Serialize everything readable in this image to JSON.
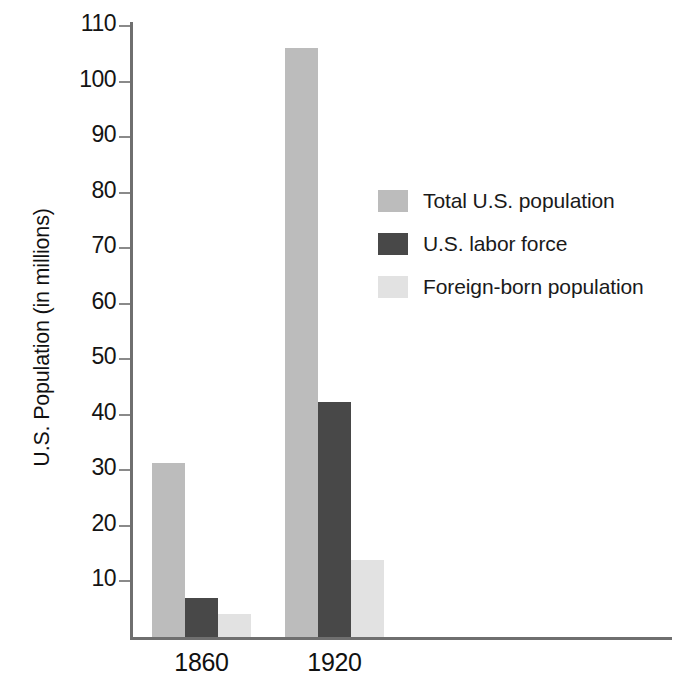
{
  "chart_data": {
    "type": "bar",
    "title": "",
    "xlabel": "",
    "ylabel": "U.S. Population (in millions)",
    "categories": [
      "1860",
      "1920"
    ],
    "series": [
      {
        "name": "Total U.S. population",
        "values": [
          31.4,
          106.0
        ],
        "color": "#bcbcbc"
      },
      {
        "name": "U.S. labor force",
        "values": [
          7.0,
          42.4
        ],
        "color": "#484848"
      },
      {
        "name": "Foreign-born population",
        "values": [
          4.1,
          13.9
        ],
        "color": "#e2e2e2"
      }
    ],
    "ylim": [
      0,
      115
    ],
    "yticks": [
      10,
      20,
      30,
      40,
      50,
      60,
      70,
      80,
      90,
      100,
      110
    ],
    "ytick_labels": [
      "10",
      "20",
      "30",
      "40",
      "50",
      "60",
      "70",
      "80",
      "90",
      "100",
      "110"
    ],
    "grid": false,
    "legend_position": "upper right"
  },
  "axis": {
    "y_title": "U.S. Population (in millions)",
    "ticks": [
      {
        "value": 110,
        "label": "110"
      },
      {
        "value": 100,
        "label": "100"
      },
      {
        "value": 90,
        "label": "90"
      },
      {
        "value": 80,
        "label": "80"
      },
      {
        "value": 70,
        "label": "70"
      },
      {
        "value": 60,
        "label": "60"
      },
      {
        "value": 50,
        "label": "50"
      },
      {
        "value": 40,
        "label": "40"
      },
      {
        "value": 30,
        "label": "30"
      },
      {
        "value": 20,
        "label": "20"
      },
      {
        "value": 10,
        "label": "10"
      }
    ]
  },
  "groups": [
    {
      "label": "1860",
      "bars": [
        {
          "series": "Total U.S. population",
          "value": 31.4
        },
        {
          "series": "U.S. labor force",
          "value": 7.0
        },
        {
          "series": "Foreign-born population",
          "value": 4.1
        }
      ]
    },
    {
      "label": "1920",
      "bars": [
        {
          "series": "Total U.S. population",
          "value": 106.0
        },
        {
          "series": "U.S. labor force",
          "value": 42.4
        },
        {
          "series": "Foreign-born population",
          "value": 13.9
        }
      ]
    }
  ],
  "legend": {
    "items": [
      {
        "label": "Total U.S. population",
        "color": "#bcbcbc"
      },
      {
        "label": "U.S. labor force",
        "color": "#484848"
      },
      {
        "label": "Foreign-born population",
        "color": "#e2e2e2"
      }
    ]
  }
}
